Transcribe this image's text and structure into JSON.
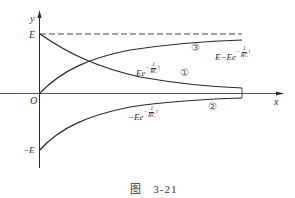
{
  "figure": {
    "caption_prefix": "图",
    "caption_number": "3-21"
  },
  "axes": {
    "x_label": "x",
    "y_label": "y",
    "origin_label": "O",
    "y_top_label": "E",
    "y_bottom_label": "−E"
  },
  "curves": [
    {
      "id": "1",
      "marker": "①",
      "expr_main": "Ee",
      "exp_neg": "−",
      "exp_num": "1",
      "exp_den": "RC",
      "exp_var": "t"
    },
    {
      "id": "2",
      "marker": "②",
      "expr_main": "−Ee",
      "exp_neg": "−",
      "exp_num": "1",
      "exp_den": "RC",
      "exp_var": "t"
    },
    {
      "id": "3",
      "marker": "③",
      "expr_main": "E−Ee",
      "exp_neg": "−",
      "exp_num": "1",
      "exp_den": "RC",
      "exp_var": "t"
    }
  ],
  "colors": {
    "line": "#2a2a2a",
    "dash": "#333333"
  }
}
